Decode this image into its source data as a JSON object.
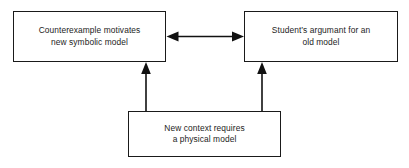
{
  "diagram": {
    "type": "flow-diagram",
    "background_color": "#ffffff",
    "line_color": "#1a1a1a",
    "text_color": "#1c1c1c",
    "nodes": [
      {
        "id": "counterexample",
        "label": "Counterexample motivates\nnew symbolic model",
        "position": "top-left"
      },
      {
        "id": "student_argument",
        "label": "Student’s argumant for an\nold model",
        "position": "top-right"
      },
      {
        "id": "new_context",
        "label": "New context requires\na physical model",
        "position": "bottom-center"
      }
    ],
    "connectors": [
      {
        "id": "counterexample-student-argument",
        "from": "counterexample",
        "to": "student_argument",
        "style": "double-headed-horizontal-arrow"
      },
      {
        "id": "new-context-to-counterexample",
        "from": "new_context",
        "to": "counterexample",
        "style": "single-headed-vertical-arrow"
      },
      {
        "id": "new-context-to-student-argument",
        "from": "new_context",
        "to": "student_argument",
        "style": "single-headed-vertical-arrow"
      }
    ]
  }
}
